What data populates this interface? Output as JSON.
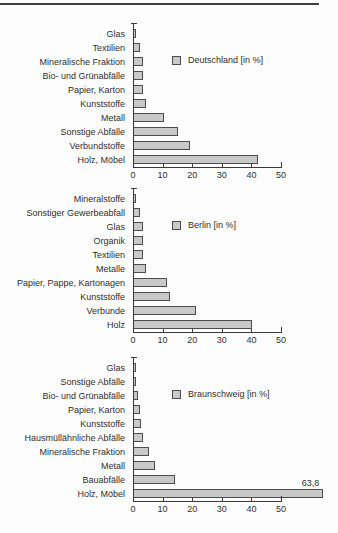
{
  "page": {
    "background": "#fdfdfd",
    "top_rule_color": "#3f3f3f",
    "axis_color": "#3a3a3a",
    "text_color": "#2e2e2e"
  },
  "chart_data": [
    {
      "type": "bar",
      "orientation": "horizontal",
      "legend": "Deutschland [in %]",
      "categories": [
        "Glas",
        "Textilien",
        "Mineralische Fraktion",
        "Bio- und Grünabfälle",
        "Papier, Karton",
        "Kunststoffe",
        "Metall",
        "Sonstige Abfälle",
        "Verbundstoffe",
        "Holz, Möbel"
      ],
      "values": [
        0.5,
        2,
        3,
        3,
        3,
        4,
        10,
        15,
        19,
        42
      ],
      "xlim": [
        0,
        50
      ],
      "xticks": [
        0,
        10,
        20,
        30,
        40,
        50
      ],
      "grid": false,
      "legend_position": "upper-right-inside",
      "bar_fill": "#c9c9c9",
      "bar_border": "#4d4d4d"
    },
    {
      "type": "bar",
      "orientation": "horizontal",
      "legend": "Berlin [in %]",
      "categories": [
        "Mineralstoffe",
        "Sonstiger Gewerbeabfall",
        "Glas",
        "Organik",
        "Textilien",
        "Metalle",
        "Papier, Pappe, Kartonagen",
        "Kunststoffe",
        "Verbunde",
        "Holz"
      ],
      "values": [
        0.5,
        2,
        3,
        3,
        3,
        4,
        11,
        12,
        21,
        40
      ],
      "xlim": [
        0,
        50
      ],
      "xticks": [
        0,
        10,
        20,
        30,
        40,
        50
      ],
      "grid": false,
      "legend_position": "upper-right-inside",
      "bar_fill": "#c9c9c9",
      "bar_border": "#4d4d4d"
    },
    {
      "type": "bar",
      "orientation": "horizontal",
      "legend": "Braunschweig [in %]",
      "categories": [
        "Glas",
        "Sonstige Abfälle",
        "Bio- und Grünabfälle",
        "Papier, Karton",
        "Kunststoffe",
        "Hausmüllähnliche Abfälle",
        "Mineralische Fraktion",
        "Metall",
        "Bauabfälle",
        "Holz, Möbel"
      ],
      "values": [
        0.3,
        0.5,
        1.5,
        2,
        2.5,
        3,
        5,
        7,
        14,
        63.8
      ],
      "value_label": {
        "index": 9,
        "text": "63,8"
      },
      "xlim": [
        0,
        50
      ],
      "xticks": [
        0,
        10,
        20,
        30,
        40,
        50
      ],
      "grid": false,
      "legend_position": "upper-right-inside",
      "bar_fill": "#c9c9c9",
      "bar_border": "#4d4d4d"
    }
  ]
}
